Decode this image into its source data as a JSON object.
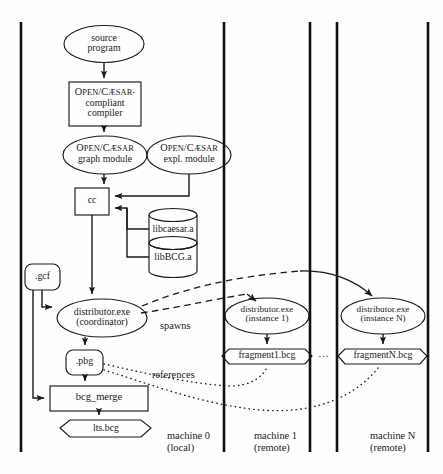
{
  "figure": {
    "type": "flow-diagram"
  },
  "nodes": {
    "source_program": {
      "label_line1": "source",
      "label_line2": "program",
      "shape": "ellipse"
    },
    "compiler": {
      "label_line1_big": "O",
      "label_line1_sm": "PEN",
      "label_slash": "/",
      "label_line1b_big": "C",
      "label_line1b_sm": "ÆSAR",
      "label_line1_tail": "-",
      "label_line2": "compliant",
      "label_line3": "compiler",
      "shape": "rectangle"
    },
    "graph_module": {
      "big1": "O",
      "sm1": "PEN",
      "slash": "/",
      "big2": "C",
      "sm2": "ÆSAR",
      "label_line2": "graph module",
      "shape": "ellipse"
    },
    "expl_module": {
      "big1": "O",
      "sm1": "PEN",
      "slash": "/",
      "big2": "C",
      "sm2": "ÆSAR",
      "label_line2": "expl. module",
      "shape": "ellipse"
    },
    "cc": {
      "label": "cc",
      "shape": "rectangle"
    },
    "libcaesar": {
      "label": "libcaesar.a",
      "shape": "cylinder"
    },
    "libbcg": {
      "label": "libBCG.a",
      "shape": "cylinder"
    },
    "gcf": {
      "label": ".gcf",
      "shape": "rounded-rectangle"
    },
    "distributor_coordinator": {
      "label_line1": "distributor.exe",
      "label_line2": "(coordinator)",
      "shape": "ellipse"
    },
    "pbg": {
      "label": ".pbg",
      "shape": "rounded-rectangle"
    },
    "bcg_merge": {
      "label": "bcg_merge",
      "shape": "rectangle"
    },
    "lts_bcg": {
      "label": "lts.bcg",
      "shape": "octagon"
    },
    "distributor_instance1": {
      "label_line1": "distributor.exe",
      "label_line2": "(instance 1)",
      "shape": "ellipse"
    },
    "fragment1": {
      "label": "fragment1.bcg",
      "shape": "octagon"
    },
    "distributor_instanceN": {
      "label_line1": "distributor.exe",
      "label_line2": "(instance N)",
      "shape": "ellipse"
    },
    "fragmentN": {
      "label": "fragmentN.bcg",
      "shape": "octagon"
    },
    "ellipsis": {
      "label": "..."
    }
  },
  "edge_labels": {
    "spawns": "spawns",
    "references": "references"
  },
  "machines": [
    {
      "name": "machine 0",
      "location": "(local)"
    },
    {
      "name": "machine 1",
      "location": "(remote)"
    },
    {
      "name": "machine N",
      "location": "(remote)"
    }
  ],
  "colors": {
    "stroke": "#1a1a1a",
    "background": "#fefefe",
    "divider": "#111111"
  }
}
